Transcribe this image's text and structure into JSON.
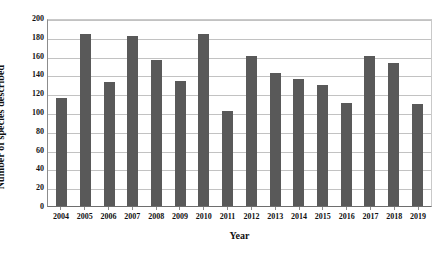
{
  "chart_data": {
    "type": "bar",
    "title": "",
    "xlabel": "Year",
    "ylabel": "Number of species described",
    "categories": [
      "2004",
      "2005",
      "2006",
      "2007",
      "2008",
      "2009",
      "2010",
      "2011",
      "2012",
      "2013",
      "2014",
      "2015",
      "2016",
      "2017",
      "2018",
      "2019"
    ],
    "values": [
      115,
      183,
      132,
      181,
      155,
      133,
      183,
      101,
      160,
      142,
      135,
      129,
      110,
      160,
      152,
      108
    ],
    "ylim": [
      0,
      200
    ],
    "ytick_labels": [
      "200",
      "180",
      "160",
      "140",
      "120",
      "100",
      "80",
      "60",
      "40",
      "20",
      "0"
    ],
    "ytick_values": [
      200,
      180,
      160,
      140,
      120,
      100,
      80,
      60,
      40,
      20,
      0
    ],
    "grid": true,
    "legend": false,
    "legend_position": "none",
    "bar_color": "#595959",
    "gridline_color": "#c2c2c2",
    "axis_color": "#6e6e6e",
    "plot_background": "#ffffff"
  }
}
